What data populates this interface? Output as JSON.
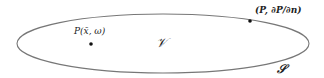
{
  "diagram": {
    "type": "domain-boundary",
    "colors": {
      "background": "#ffffff",
      "boundary_stroke": "#777777",
      "point_fill": "#111111",
      "text": "#222222"
    },
    "region": {
      "shape": "ellipse",
      "cx": 163,
      "cy": 43.5,
      "rx": 146,
      "ry": 29.5,
      "label": "𝒱"
    },
    "boundary": {
      "label": "𝒮"
    },
    "interior_point": {
      "x": 91,
      "y": 44,
      "label": "P(x̄, ω)"
    },
    "boundary_point": {
      "x": 250,
      "y": 21,
      "label": "(P, ∂P/∂n)"
    }
  }
}
